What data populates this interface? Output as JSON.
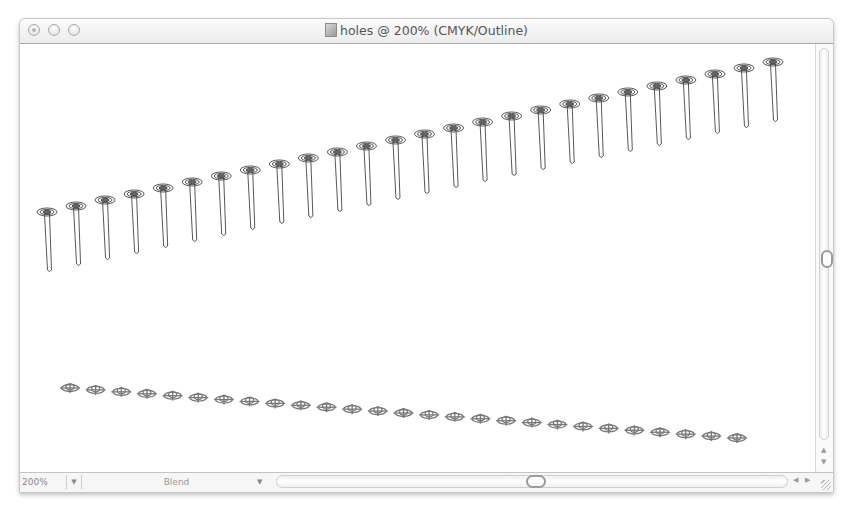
{
  "window": {
    "title": "holes @ 200% (CMYK/Outline)",
    "document_name": "holes",
    "zoom_level": "200%",
    "color_mode": "CMYK",
    "view_mode": "Outline"
  },
  "titlebar": {
    "buttons": [
      "close",
      "minimize",
      "zoom"
    ]
  },
  "statusbar": {
    "zoom_value": "200%",
    "zoom_dropdown_icon": "triangle-down-icon",
    "status_label": "Blend",
    "status_dropdown_icon": "triangle-down-icon"
  },
  "scrollbars": {
    "vertical": {
      "thumb_position_pct": 50,
      "up_icon": "arrow-up-icon",
      "down_icon": "arrow-down-icon"
    },
    "horizontal": {
      "thumb_position_pct": 50,
      "left_icon": "arrow-left-icon",
      "right_icon": "arrow-right-icon"
    }
  },
  "artwork": {
    "nails": {
      "count": 26,
      "first_head": [
        47,
        212
      ],
      "last_head": [
        773,
        62
      ],
      "shaft_length": 58,
      "stroke": "#444444"
    },
    "holes": {
      "count": 27,
      "first": [
        70,
        388
      ],
      "last": [
        737,
        438
      ],
      "stroke": "#777777"
    }
  },
  "colors": {
    "titlebar_top": "#fbfbfb",
    "titlebar_bottom": "#ececec",
    "canvas": "#ffffff",
    "outline_stroke": "#444444"
  }
}
